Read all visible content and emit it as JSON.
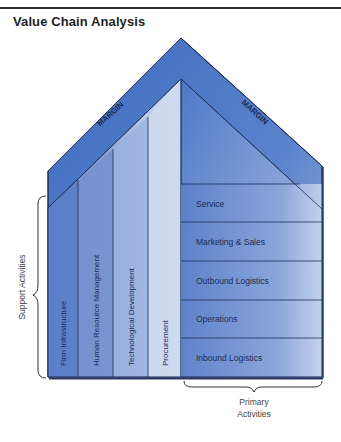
{
  "title": "Value Chain Analysis",
  "margin_labels": [
    "MARGIN",
    "MARGIN"
  ],
  "support_activities": {
    "label": "Support Activities",
    "items": [
      "Firm Infrastructure",
      "Human Resource Management",
      "Technological Development",
      "Procurement"
    ]
  },
  "primary_activities": {
    "label_line1": "Primary",
    "label_line2": "Activities",
    "items": [
      "Service",
      "Marketing & Sales",
      "Outbound Logistics",
      "Operations",
      "Inbound Logistics"
    ]
  },
  "colors": {
    "roof": "#4a74c2",
    "roof_light": "#8fa8d8",
    "panel_dark": "#5a7fc8",
    "panel_light": "#d9e3f3",
    "outline": "#1f2f5a"
  }
}
